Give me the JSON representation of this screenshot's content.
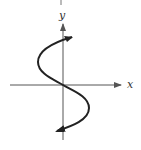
{
  "figure": {
    "type": "parametric-curve-graph",
    "axes": {
      "x_label": "x",
      "y_label": "y"
    },
    "colors": {
      "axis": "#555555",
      "curve": "#222222",
      "background": "#ffffff"
    }
  }
}
